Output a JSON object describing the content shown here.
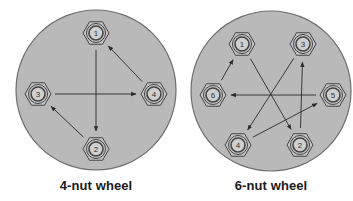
{
  "colors": {
    "wheel_fill": "#b9b9b9",
    "wheel_stroke": "#6e6e6e",
    "nut_fill": "#c4c4c4",
    "nut_stroke": "#444444",
    "arrow": "#2a2a2a",
    "label": "#1a1a1a"
  },
  "wheels": [
    {
      "id": "four-nut",
      "caption": "4-nut wheel",
      "center": [
        96,
        90
      ],
      "radius": 80,
      "nuts": [
        {
          "label": "1",
          "x": 96,
          "y": 33
        },
        {
          "label": "2",
          "x": 96,
          "y": 149
        },
        {
          "label": "3",
          "x": 38,
          "y": 94
        },
        {
          "label": "4",
          "x": 154,
          "y": 94
        }
      ],
      "sequence": [
        "1",
        "2",
        "3",
        "4",
        "1"
      ]
    },
    {
      "id": "six-nut",
      "caption": "6-nut wheel",
      "center": [
        271,
        91
      ],
      "radius": 80,
      "nuts": [
        {
          "label": "1",
          "x": 242,
          "y": 44
        },
        {
          "label": "2",
          "x": 300,
          "y": 145
        },
        {
          "label": "3",
          "x": 303,
          "y": 44
        },
        {
          "label": "4",
          "x": 238,
          "y": 145
        },
        {
          "label": "5",
          "x": 333,
          "y": 95
        },
        {
          "label": "6",
          "x": 213,
          "y": 95
        }
      ],
      "sequence": [
        "1",
        "2",
        "3",
        "4",
        "5",
        "6",
        "1"
      ]
    }
  ]
}
